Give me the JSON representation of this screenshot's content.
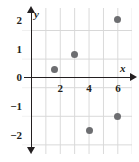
{
  "figure": {
    "kind": "coordinate-plane-scatter-plot",
    "background_color": "#ffffff",
    "grid_color": "#d8d8d8",
    "axis_color": "#231f20",
    "point_color": "#6d6e71"
  },
  "axes": {
    "x_name": "x",
    "y_name": "y",
    "x_ticks": [
      {
        "label": "2",
        "value": 2
      },
      {
        "label": "4",
        "value": 4
      },
      {
        "label": "6",
        "value": 6
      }
    ],
    "y_ticks": [
      {
        "label": "2",
        "value": 2
      },
      {
        "label": "1",
        "value": 1
      },
      {
        "label": "0",
        "value": 0
      },
      {
        "label": "−1",
        "value": -1
      },
      {
        "label": "−2",
        "value": -2
      }
    ]
  },
  "chart_data": {
    "type": "scatter",
    "title": "",
    "xlabel": "x",
    "ylabel": "y",
    "xlim": [
      -0.5,
      7.0
    ],
    "ylim": [
      -2.45,
      2.6
    ],
    "grid": true,
    "legend": false,
    "x": [
      1.6,
      3.0,
      4.0,
      6.0,
      6.0
    ],
    "y": [
      0.3,
      0.8,
      -1.85,
      2.05,
      -1.35
    ],
    "points": [
      {
        "x": 1.6,
        "y": 0.3
      },
      {
        "x": 3.0,
        "y": 0.8
      },
      {
        "x": 4.0,
        "y": -1.85
      },
      {
        "x": 6.0,
        "y": 2.05
      },
      {
        "x": 6.0,
        "y": -1.35
      }
    ],
    "xticks": [
      2,
      4,
      6
    ],
    "yticks": [
      2,
      1,
      0,
      -1,
      -2
    ],
    "marker_color": "#6d6e71",
    "marker_size": 7
  }
}
